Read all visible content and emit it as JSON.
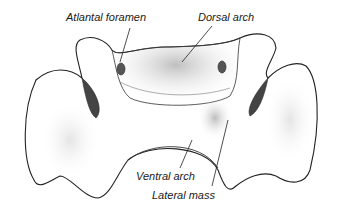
{
  "diagram": {
    "labels": [
      {
        "text": "Atlantal foramen",
        "x": 66,
        "y": 12
      },
      {
        "text": "Dorsal arch",
        "x": 198,
        "y": 12
      },
      {
        "text": "Ventral arch",
        "x": 136,
        "y": 171
      },
      {
        "text": "Lateral mass",
        "x": 152,
        "y": 190
      }
    ],
    "colors": {
      "outline": "#222222",
      "shade": "#9a9a9a",
      "background": "#ffffff"
    }
  }
}
